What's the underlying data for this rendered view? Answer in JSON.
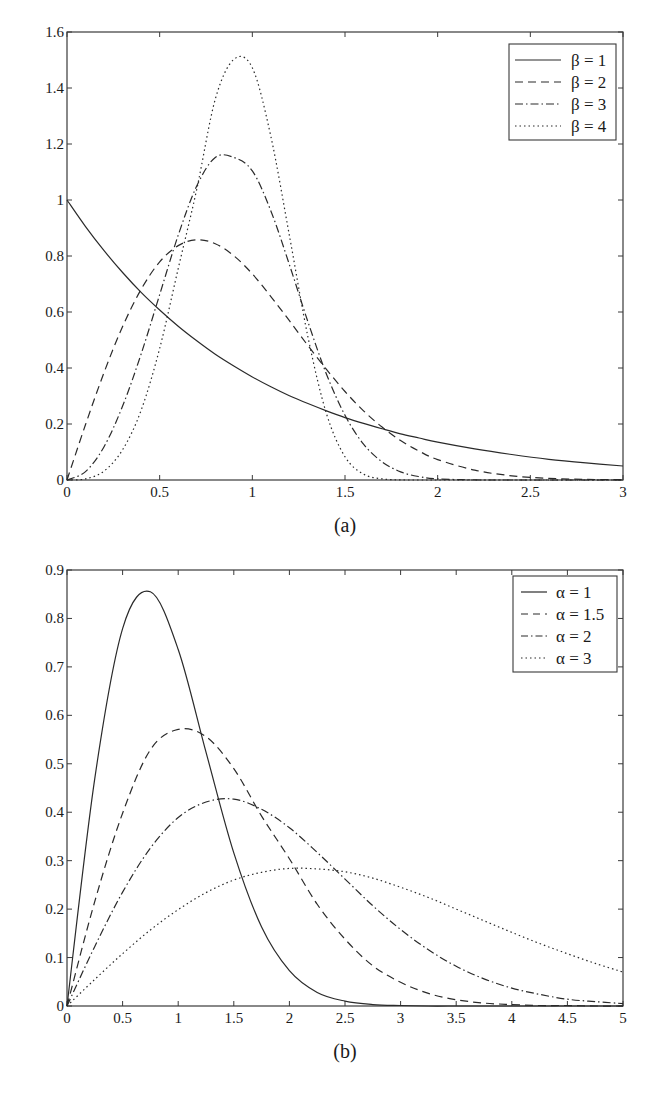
{
  "figure": {
    "panels": [
      {
        "caption": "(a)",
        "legend": [
          "β = 1",
          "β = 2",
          "β = 3",
          "β = 4"
        ],
        "x_ticks": [
          "0",
          "0.5",
          "1",
          "1.5",
          "2",
          "2.5",
          "3"
        ],
        "y_ticks": [
          "0",
          "0.2",
          "0.4",
          "0.6",
          "0.8",
          "1",
          "1.2",
          "1.4",
          "1.6"
        ]
      },
      {
        "caption": "(b)",
        "legend": [
          "α = 1",
          "α = 1.5",
          "α = 2",
          "α = 3"
        ],
        "x_ticks": [
          "0",
          "0.5",
          "1",
          "1.5",
          "2",
          "2.5",
          "3",
          "3.5",
          "4",
          "4.5",
          "5"
        ],
        "y_ticks": [
          "0",
          "0.1",
          "0.2",
          "0.3",
          "0.4",
          "0.5",
          "0.6",
          "0.7",
          "0.8",
          "0.9"
        ]
      }
    ]
  },
  "chart_data": [
    {
      "type": "line",
      "title": "(a)",
      "xlabel": "",
      "ylabel": "",
      "xlim": [
        0,
        3
      ],
      "ylim": [
        0,
        1.6
      ],
      "grid": false,
      "legend_position": "upper right",
      "x": [
        0,
        0.1,
        0.2,
        0.3,
        0.4,
        0.5,
        0.6,
        0.7,
        0.8,
        0.9,
        1.0,
        1.1,
        1.2,
        1.3,
        1.4,
        1.5,
        1.6,
        1.7,
        1.8,
        1.9,
        2.0,
        2.2,
        2.4,
        2.6,
        2.8,
        3.0
      ],
      "series": [
        {
          "name": "β = 1",
          "style": "solid",
          "values": [
            1.0,
            0.905,
            0.819,
            0.741,
            0.67,
            0.607,
            0.549,
            0.497,
            0.449,
            0.407,
            0.368,
            0.333,
            0.301,
            0.273,
            0.247,
            0.223,
            0.202,
            0.183,
            0.165,
            0.15,
            0.135,
            0.111,
            0.091,
            0.074,
            0.061,
            0.05
          ]
        },
        {
          "name": "β = 2",
          "style": "dashed",
          "values": [
            0,
            0.198,
            0.384,
            0.548,
            0.681,
            0.779,
            0.837,
            0.858,
            0.844,
            0.801,
            0.736,
            0.655,
            0.569,
            0.48,
            0.395,
            0.316,
            0.247,
            0.189,
            0.141,
            0.103,
            0.073,
            0.035,
            0.015,
            0.006,
            0.002,
            0.001
          ]
        },
        {
          "name": "β = 3",
          "style": "dashdot",
          "values": [
            0,
            0.03,
            0.119,
            0.264,
            0.45,
            0.662,
            0.874,
            1.05,
            1.152,
            1.152,
            1.104,
            0.961,
            0.769,
            0.565,
            0.378,
            0.231,
            0.128,
            0.065,
            0.029,
            0.012,
            0.004,
            0.0003,
            0,
            0,
            0,
            0
          ]
        },
        {
          "name": "β = 4",
          "style": "dotted",
          "values": [
            0,
            0.004,
            0.032,
            0.108,
            0.249,
            0.47,
            0.755,
            1.038,
            1.36,
            1.502,
            1.472,
            1.227,
            0.873,
            0.511,
            0.237,
            0.083,
            0.021,
            0.004,
            0.0004,
            0,
            0,
            0,
            0,
            0,
            0,
            0
          ]
        }
      ]
    },
    {
      "type": "line",
      "title": "(b)",
      "xlabel": "",
      "ylabel": "",
      "xlim": [
        0,
        5
      ],
      "ylim": [
        0,
        0.9
      ],
      "grid": false,
      "legend_position": "upper right",
      "x": [
        0,
        0.25,
        0.5,
        0.75,
        1.0,
        1.25,
        1.5,
        1.75,
        2.0,
        2.25,
        2.5,
        2.75,
        3.0,
        3.25,
        3.5,
        3.75,
        4.0,
        4.25,
        4.5,
        4.75,
        5.0
      ],
      "series": [
        {
          "name": "α = 1",
          "style": "solid",
          "values": [
            0,
            0.47,
            0.779,
            0.855,
            0.736,
            0.524,
            0.316,
            0.163,
            0.073,
            0.028,
            0.01,
            0.003,
            0.001,
            0,
            0,
            0,
            0,
            0,
            0,
            0,
            0
          ]
        },
        {
          "name": "α = 1.5",
          "style": "dashed",
          "values": [
            0,
            0.216,
            0.398,
            0.529,
            0.571,
            0.556,
            0.49,
            0.392,
            0.304,
            0.21,
            0.138,
            0.083,
            0.049,
            0.026,
            0.013,
            0.006,
            0.003,
            0.001,
            0.001,
            0,
            0
          ]
        },
        {
          "name": "α = 2",
          "style": "dashdot",
          "values": [
            0,
            0.123,
            0.235,
            0.326,
            0.389,
            0.421,
            0.427,
            0.406,
            0.368,
            0.317,
            0.262,
            0.207,
            0.158,
            0.116,
            0.082,
            0.056,
            0.037,
            0.024,
            0.014,
            0.009,
            0.005
          ]
        },
        {
          "name": "α = 3",
          "style": "dotted",
          "values": [
            0,
            0.055,
            0.108,
            0.157,
            0.199,
            0.234,
            0.26,
            0.276,
            0.284,
            0.283,
            0.277,
            0.264,
            0.245,
            0.224,
            0.2,
            0.176,
            0.152,
            0.129,
            0.108,
            0.088,
            0.07
          ]
        }
      ]
    }
  ]
}
